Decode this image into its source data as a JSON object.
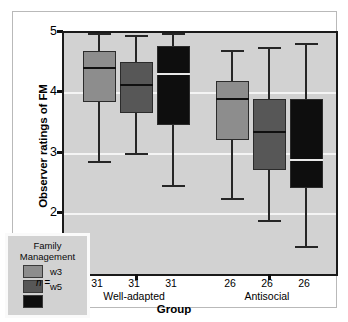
{
  "chart_data": {
    "type": "box",
    "title": "",
    "xlabel": "Group",
    "ylabel": "Observer ratings of FM",
    "ylim": [
      1,
      5
    ],
    "yticks": [
      1,
      2,
      3,
      4,
      5
    ],
    "ytick_labels": [
      "1",
      "2",
      "3",
      "4",
      "5"
    ],
    "grid": "horizontal-white",
    "categories": [
      "Well-adapted",
      "Antisocial"
    ],
    "legend": {
      "title_line1": "Family",
      "title_line2": "Management",
      "position": "inside-lower-left",
      "entries": [
        {
          "label": "w3",
          "color": "#8d8d8d"
        },
        {
          "label": "w5",
          "color": "#575757"
        },
        {
          "label": "",
          "color": "#0e0e0e"
        }
      ]
    },
    "n_prefix": "n =",
    "groups": [
      {
        "name": "Well-adapted",
        "boxes": [
          {
            "series": "w3",
            "n": "31",
            "whisker_low": 2.85,
            "q1": 3.85,
            "median": 4.42,
            "q3": 4.7,
            "whisker_high": 5.0,
            "color": "#8d8d8d",
            "median_color": "#101010"
          },
          {
            "series": "w5",
            "n": "31",
            "whisker_low": 2.98,
            "q1": 3.68,
            "median": 4.13,
            "q3": 4.52,
            "whisker_high": 4.97,
            "color": "#575757",
            "median_color": "#101010"
          },
          {
            "series": "w8",
            "n": "31",
            "whisker_low": 2.45,
            "q1": 3.48,
            "median": 4.32,
            "q3": 4.78,
            "whisker_high": 5.0,
            "color": "#0e0e0e",
            "median_color": "#e8e8e8"
          }
        ]
      },
      {
        "name": "Antisocial",
        "boxes": [
          {
            "series": "w3",
            "n": "26",
            "whisker_low": 2.23,
            "q1": 3.22,
            "median": 3.9,
            "q3": 4.2,
            "whisker_high": 4.72,
            "color": "#8d8d8d",
            "median_color": "#101010"
          },
          {
            "series": "w5",
            "n": "26",
            "whisker_low": 1.87,
            "q1": 2.72,
            "median": 3.35,
            "q3": 3.9,
            "whisker_high": 4.76,
            "color": "#575757",
            "median_color": "#101010"
          },
          {
            "series": "w8",
            "n": "26",
            "whisker_low": 1.43,
            "q1": 2.42,
            "median": 2.9,
            "q3": 3.9,
            "whisker_high": 4.83,
            "color": "#0e0e0e",
            "median_color": "#e8e8e8"
          }
        ]
      }
    ]
  }
}
